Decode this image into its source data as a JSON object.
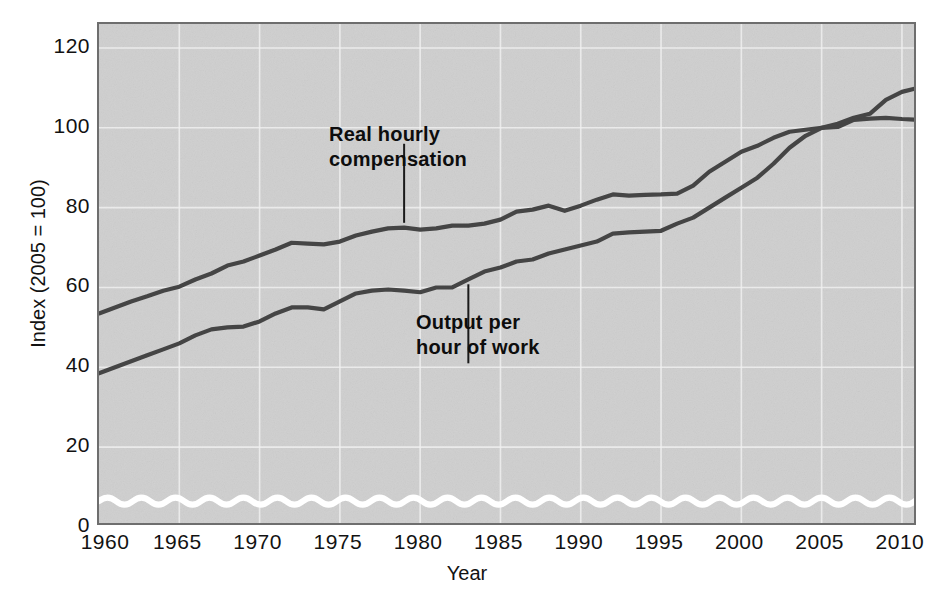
{
  "chart_data": {
    "type": "line",
    "title": "",
    "xlabel": "Year",
    "ylabel": "Index (2005 = 100)",
    "xlim": [
      1960,
      2011
    ],
    "ylim": [
      0,
      126
    ],
    "xticks": [
      1960,
      1965,
      1970,
      1975,
      1980,
      1985,
      1990,
      1995,
      2000,
      2005,
      2010
    ],
    "yticks": [
      0,
      20,
      40,
      60,
      80,
      100,
      120
    ],
    "grid": true,
    "legend_position": "inline-annotations",
    "axis_break": {
      "value": 6.5,
      "style": "wavy-white-line",
      "label": ""
    },
    "annotations": [
      {
        "name": "real-hourly-compensation",
        "text": "Real hourly\ncompensation",
        "points_to_year": 1979,
        "points_to_value": 75
      },
      {
        "name": "output-per-hour-of-work",
        "text": "Output per\nhour of work",
        "points_to_year": 1983,
        "points_to_value": 62
      }
    ],
    "series": [
      {
        "name": "Real hourly compensation",
        "color": "#454545",
        "x": [
          1960,
          1961,
          1962,
          1963,
          1964,
          1965,
          1966,
          1967,
          1968,
          1969,
          1970,
          1971,
          1972,
          1973,
          1974,
          1975,
          1976,
          1977,
          1978,
          1979,
          1980,
          1981,
          1982,
          1983,
          1984,
          1985,
          1986,
          1987,
          1988,
          1989,
          1990,
          1991,
          1992,
          1993,
          1994,
          1995,
          1996,
          1997,
          1998,
          1999,
          2000,
          2001,
          2002,
          2003,
          2004,
          2005,
          2006,
          2007,
          2008,
          2009,
          2010,
          2011
        ],
        "values": [
          53.5,
          55.0,
          56.5,
          57.8,
          59.2,
          60.2,
          62.0,
          63.5,
          65.5,
          66.5,
          68.0,
          69.5,
          71.2,
          71.0,
          70.8,
          71.5,
          73.0,
          74.0,
          74.8,
          75.0,
          74.5,
          74.8,
          75.5,
          75.5,
          76.0,
          77.0,
          79.0,
          79.5,
          80.5,
          79.2,
          80.5,
          82.0,
          83.3,
          83.0,
          83.2,
          83.3,
          83.5,
          85.5,
          89.0,
          91.5,
          94.0,
          95.5,
          97.5,
          99.0,
          99.5,
          100.0,
          100.2,
          102.0,
          102.3,
          102.5,
          102.2,
          102.0
        ]
      },
      {
        "name": "Output per hour of work",
        "color": "#454545",
        "x": [
          1960,
          1961,
          1962,
          1963,
          1964,
          1965,
          1966,
          1967,
          1968,
          1969,
          1970,
          1971,
          1972,
          1973,
          1974,
          1975,
          1976,
          1977,
          1978,
          1979,
          1980,
          1981,
          1982,
          1983,
          1984,
          1985,
          1986,
          1987,
          1988,
          1989,
          1990,
          1991,
          1992,
          1993,
          1994,
          1995,
          1996,
          1997,
          1998,
          1999,
          2000,
          2001,
          2002,
          2003,
          2004,
          2005,
          2006,
          2007,
          2008,
          2009,
          2010,
          2011
        ],
        "values": [
          38.5,
          40.0,
          41.5,
          43.0,
          44.5,
          46.0,
          48.0,
          49.5,
          50.0,
          50.2,
          51.5,
          53.5,
          55.0,
          55.0,
          54.5,
          56.5,
          58.5,
          59.2,
          59.5,
          59.2,
          58.8,
          60.0,
          60.0,
          62.0,
          64.0,
          65.0,
          66.5,
          67.0,
          68.5,
          69.5,
          70.5,
          71.5,
          73.5,
          73.8,
          74.0,
          74.2,
          76.0,
          77.5,
          80.0,
          82.5,
          85.0,
          87.5,
          91.0,
          95.0,
          98.0,
          100.0,
          101.0,
          102.5,
          103.5,
          107.0,
          109.0,
          110.0
        ]
      }
    ]
  },
  "axis": {
    "y_title": "Index (2005 = 100)",
    "x_title": "Year",
    "yticks": [
      "0",
      "20",
      "40",
      "60",
      "80",
      "100",
      "120"
    ],
    "xticks": [
      "1960",
      "1965",
      "1970",
      "1975",
      "1980",
      "1985",
      "1990",
      "1995",
      "2000",
      "2005",
      "2010"
    ]
  },
  "annotations": {
    "compensation": "Real hourly\ncompensation",
    "productivity": "Output per\nhour of work"
  },
  "colors": {
    "plot_background": "#cfcfcf",
    "plot_border": "#6e6e6e",
    "gridline": "#f0f0f0",
    "line": "#454545",
    "text": "#121212",
    "axis_break": "#ffffff"
  }
}
